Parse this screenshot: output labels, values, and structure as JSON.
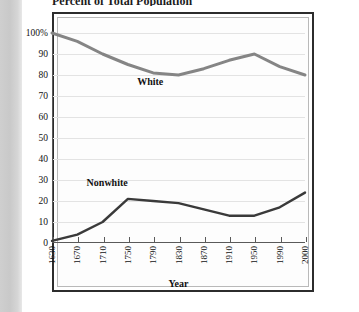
{
  "page": {
    "title": "Percent of Total Population"
  },
  "axis": {
    "x_title": "Year"
  },
  "series_labels": {
    "white": "White",
    "nonwhite": "Nonwhite"
  },
  "colors": {
    "white_line": "#858585",
    "nonwhite_line": "#3a3a3a",
    "axis": "#5a5a5a",
    "grid": "#e3e3e3",
    "frame": "#2c2c2c",
    "text": "#111111"
  },
  "chart_data": {
    "type": "line",
    "title": "Percent of Total Population",
    "xlabel": "Year",
    "ylabel": "",
    "x": [
      "1630",
      "1670",
      "1710",
      "1750",
      "1790",
      "1830",
      "1870",
      "1910",
      "1950",
      "1990",
      "2000"
    ],
    "categories": [
      "1630",
      "1670",
      "1710",
      "1750",
      "1790",
      "1830",
      "1870",
      "1910",
      "1950",
      "1990",
      "2000"
    ],
    "ylim": [
      0,
      100
    ],
    "yticks": [
      0,
      10,
      20,
      30,
      40,
      50,
      60,
      70,
      80,
      90,
      100
    ],
    "ytick_labels": [
      "0",
      "10",
      "20",
      "30",
      "40",
      "50",
      "60",
      "70",
      "80",
      "90",
      "100%"
    ],
    "grid": true,
    "legend": "inline-annotations",
    "series": [
      {
        "name": "White",
        "values": [
          100,
          96,
          90,
          85,
          81,
          80,
          83,
          87,
          90,
          84,
          80
        ]
      },
      {
        "name": "Nonwhite",
        "values": [
          1,
          4,
          10,
          21,
          20,
          19,
          16,
          13,
          13,
          17,
          24
        ]
      }
    ],
    "annotations": [
      {
        "text": "White",
        "x": "1790",
        "y": 76
      },
      {
        "text": "Nonwhite",
        "x": "1710",
        "y": 28
      }
    ]
  }
}
